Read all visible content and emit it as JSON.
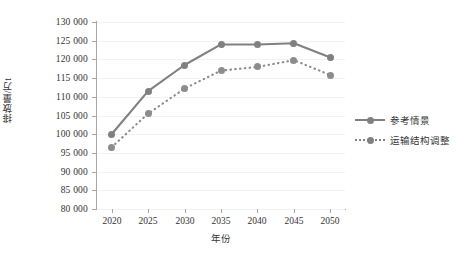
{
  "chart_data": {
    "type": "line",
    "title": "",
    "xlabel": "年份",
    "ylabel": "排放量/万t",
    "x": [
      2020,
      2025,
      2030,
      2035,
      2040,
      2045,
      2050
    ],
    "xlim": [
      2018,
      2052
    ],
    "ylim": [
      80000,
      130000
    ],
    "ytick_labels": [
      "130 000",
      "125 000",
      "120 000",
      "115 000",
      "110 000",
      "105 000",
      "100 000",
      "95 000",
      "90 000",
      "85 000",
      "80 000"
    ],
    "ytick_values": [
      130000,
      125000,
      120000,
      115000,
      110000,
      105000,
      100000,
      95000,
      90000,
      85000,
      80000
    ],
    "xtick_labels": [
      "2020",
      "2025",
      "2030",
      "2035",
      "2040",
      "2045",
      "2050"
    ],
    "grid": true,
    "legend_position": "right",
    "series": [
      {
        "name": "参考情景",
        "style": "solid",
        "color": "#808080",
        "values": [
          100000,
          111500,
          118500,
          124000,
          124000,
          124300,
          120500
        ]
      },
      {
        "name": "运输结构调整",
        "style": "dotted",
        "color": "#8c8c8c",
        "values": [
          96500,
          105500,
          112200,
          117000,
          118000,
          119800,
          115800
        ]
      }
    ]
  },
  "legend": {
    "items": [
      {
        "label": "参考情景",
        "style": "solid"
      },
      {
        "label": "运输结构调整",
        "style": "dotted"
      }
    ]
  },
  "axes": {
    "y_title": "排放量/万t",
    "x_title": "年份"
  }
}
